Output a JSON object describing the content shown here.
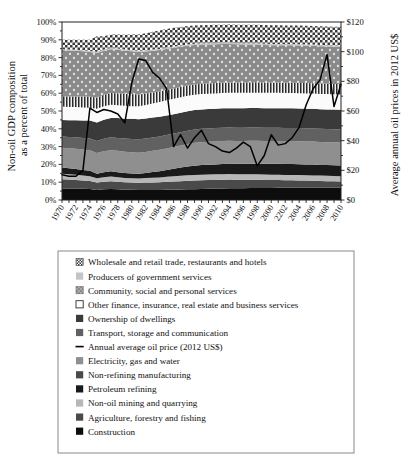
{
  "chart_data": {
    "type": "area",
    "title": "",
    "subtitle": "",
    "ylabel": "Non-oil GDP composition as a percent of total",
    "ylabel_right": "Average annual oil prices in 2012 US$",
    "xlabel": "",
    "ylim": [
      0,
      100
    ],
    "ylim_right": [
      0,
      120
    ],
    "ytick_labels": [
      "0%",
      "10%",
      "20%",
      "30%",
      "40%",
      "50%",
      "60%",
      "70%",
      "80%",
      "90%",
      "100%"
    ],
    "ytick_values": [
      0,
      10,
      20,
      30,
      40,
      50,
      60,
      70,
      80,
      90,
      100
    ],
    "ytick_labels_right": [
      "$0",
      "$20",
      "$40",
      "$60",
      "$80",
      "$100",
      "$120"
    ],
    "ytick_values_right": [
      0,
      20,
      40,
      60,
      80,
      100,
      120
    ],
    "grid": false,
    "legend_position": "bottom",
    "x": [
      1970,
      1971,
      1972,
      1973,
      1974,
      1975,
      1976,
      1977,
      1978,
      1979,
      1980,
      1981,
      1982,
      1983,
      1984,
      1985,
      1986,
      1987,
      1988,
      1989,
      1990,
      1991,
      1992,
      1993,
      1994,
      1995,
      1996,
      1997,
      1998,
      1999,
      2000,
      2001,
      2002,
      2003,
      2004,
      2005,
      2006,
      2007,
      2008,
      2009,
      2010
    ],
    "xtick_labels": [
      "1970",
      "1972",
      "1974",
      "1976",
      "1978",
      "1980",
      "1982",
      "1984",
      "1986",
      "1988",
      "1990",
      "1992",
      "1994",
      "1996",
      "1998",
      "2000",
      "2202",
      "2004",
      "2006",
      "2008",
      "2010"
    ],
    "xtick_values": [
      1970,
      1972,
      1974,
      1976,
      1978,
      1980,
      1982,
      1984,
      1986,
      1988,
      1990,
      1992,
      1994,
      1996,
      1998,
      2000,
      2002,
      2004,
      2006,
      2008,
      2010
    ],
    "stack_order_bottom_to_top": [
      "Construction",
      "Agriculture, forestry and fishing",
      "Non-oil mining and quarrying",
      "Petroleum refining",
      "Non-refining manufacturing",
      "Electricity, gas and water",
      "Transport, storage and communication",
      "Ownership of dwellings",
      "Other finance, insurance, real estate and business services",
      "Community, social and personal services",
      "Producers of government services",
      "Wholesale and retail trade, restaurants and hotels"
    ],
    "series": [
      {
        "name": "Construction",
        "fill": "#0d0d0d",
        "pattern": "solid",
        "values": [
          6.5,
          6.5,
          6.4,
          6.3,
          6.2,
          5.6,
          6.0,
          6.2,
          6.0,
          5.8,
          5.7,
          5.6,
          5.6,
          5.6,
          5.6,
          5.7,
          5.8,
          5.9,
          6.0,
          6.1,
          6.2,
          6.3,
          6.4,
          6.5,
          6.6,
          6.6,
          6.6,
          6.7,
          6.8,
          6.8,
          6.8,
          6.9,
          6.9,
          7.0,
          7.0,
          7.0,
          7.0,
          7.0,
          7.0,
          7.0,
          7.0
        ]
      },
      {
        "name": "Agriculture, forestry and fishing",
        "fill": "#4a4a4a",
        "pattern": "solid",
        "values": [
          5.2,
          5.0,
          4.9,
          4.7,
          4.5,
          4.3,
          4.3,
          4.4,
          4.3,
          4.2,
          4.1,
          4.1,
          4.2,
          4.3,
          4.4,
          4.5,
          4.6,
          4.7,
          4.8,
          4.9,
          4.9,
          4.9,
          4.9,
          4.9,
          4.9,
          4.8,
          4.8,
          4.7,
          4.6,
          4.5,
          4.4,
          4.3,
          4.2,
          4.1,
          4.0,
          3.9,
          3.8,
          3.7,
          3.6,
          3.5,
          3.4
        ]
      },
      {
        "name": "Non-oil mining and quarrying",
        "fill": "#b7b7b7",
        "pattern": "solid",
        "values": [
          3.1,
          3.0,
          2.9,
          2.8,
          2.7,
          2.3,
          2.5,
          2.6,
          2.5,
          2.4,
          2.4,
          2.4,
          2.5,
          2.6,
          2.7,
          2.8,
          2.9,
          3.0,
          3.1,
          3.1,
          3.1,
          3.1,
          3.1,
          3.1,
          3.1,
          3.0,
          3.0,
          3.0,
          3.0,
          3.0,
          3.0,
          3.0,
          3.0,
          3.0,
          3.0,
          3.0,
          3.0,
          3.0,
          3.0,
          3.0,
          3.0
        ]
      },
      {
        "name": "Petroleum refining",
        "fill": "#1a1a1a",
        "pattern": "solid",
        "values": [
          3.4,
          3.3,
          3.2,
          3.1,
          3.0,
          2.5,
          2.8,
          2.9,
          2.8,
          2.7,
          2.7,
          2.7,
          2.9,
          3.2,
          3.5,
          3.9,
          4.3,
          4.6,
          4.9,
          5.2,
          5.4,
          5.5,
          5.6,
          5.7,
          5.8,
          5.9,
          5.9,
          6.0,
          6.0,
          6.0,
          6.1,
          6.1,
          6.1,
          6.1,
          6.1,
          6.1,
          6.1,
          6.0,
          6.0,
          6.0,
          6.0
        ]
      },
      {
        "name": "Non-refining manufacturing",
        "fill": "#8f8f8f",
        "pattern": "solid",
        "values": [
          11.2,
          11.3,
          11.4,
          11.5,
          11.6,
          11.7,
          11.8,
          11.9,
          12.0,
          12.0,
          11.9,
          11.8,
          11.8,
          11.9,
          12.0,
          12.1,
          12.2,
          12.4,
          12.6,
          12.8,
          12.9,
          12.9,
          12.9,
          12.9,
          12.9,
          12.9,
          12.9,
          12.9,
          12.9,
          12.9,
          12.9,
          12.9,
          12.9,
          12.9,
          12.9,
          12.9,
          12.9,
          12.9,
          12.9,
          12.9,
          12.9
        ]
      },
      {
        "name": "Electricity, gas and water",
        "fill": "#616161",
        "pattern": "solid",
        "values": [
          6.3,
          6.3,
          6.4,
          6.5,
          6.6,
          6.8,
          7.0,
          7.2,
          7.3,
          7.4,
          7.5,
          7.5,
          7.5,
          7.5,
          7.5,
          7.5,
          7.5,
          7.5,
          7.5,
          7.5,
          7.5,
          7.5,
          7.5,
          7.5,
          7.4,
          7.4,
          7.4,
          7.4,
          7.4,
          7.4,
          7.4,
          7.4,
          7.4,
          7.4,
          7.4,
          7.4,
          7.4,
          7.4,
          7.4,
          7.4,
          7.4
        ]
      },
      {
        "name": "Transport, storage and communication",
        "fill": "#3a3a3a",
        "pattern": "solid",
        "values": [
          9.2,
          9.4,
          9.6,
          9.8,
          10.0,
          10.4,
          10.7,
          10.9,
          11.1,
          11.2,
          11.3,
          11.3,
          11.3,
          11.2,
          11.1,
          11.0,
          10.9,
          10.9,
          10.9,
          10.9,
          10.9,
          10.9,
          10.9,
          10.9,
          10.9,
          11.0,
          11.0,
          11.0,
          11.0,
          11.0,
          11.0,
          11.0,
          11.0,
          11.0,
          11.0,
          11.0,
          11.0,
          11.0,
          11.0,
          11.0,
          11.0
        ]
      },
      {
        "name": "Ownership of dwellings",
        "fill": "#fbfbfb",
        "pattern": "solid",
        "values": [
          7.6,
          7.5,
          7.4,
          7.3,
          7.2,
          7.6,
          7.5,
          7.4,
          7.3,
          7.2,
          7.1,
          7.3,
          7.6,
          7.9,
          8.2,
          8.5,
          8.7,
          8.7,
          8.7,
          8.6,
          8.6,
          8.6,
          8.6,
          8.6,
          8.6,
          8.6,
          8.6,
          8.6,
          8.6,
          8.6,
          8.6,
          8.6,
          8.6,
          8.6,
          8.6,
          8.6,
          8.6,
          8.6,
          8.6,
          8.6,
          8.6
        ]
      },
      {
        "name": "Other finance, insurance, real estate and business services",
        "fill": "#d6d6d6",
        "pattern": "vertical-stripes",
        "values": [
          5.8,
          5.9,
          6.0,
          6.1,
          6.2,
          6.4,
          6.5,
          6.6,
          6.7,
          6.8,
          6.8,
          6.6,
          6.4,
          6.2,
          6.0,
          5.9,
          5.8,
          5.8,
          5.8,
          5.8,
          5.8,
          5.8,
          5.8,
          5.8,
          5.8,
          5.8,
          5.8,
          5.8,
          5.8,
          5.8,
          5.8,
          5.8,
          5.8,
          5.8,
          5.8,
          5.8,
          5.8,
          5.8,
          5.8,
          5.8,
          5.8
        ]
      },
      {
        "name": "Community, social and personal services",
        "fill": "#8a8a8a",
        "pattern": "dots",
        "values": [
          26.0,
          25.8,
          25.6,
          25.4,
          25.2,
          25.0,
          24.8,
          24.6,
          24.4,
          24.2,
          24.0,
          23.8,
          23.6,
          23.4,
          23.2,
          23.0,
          22.8,
          22.6,
          22.4,
          22.2,
          22.0,
          21.9,
          21.8,
          21.7,
          21.6,
          21.5,
          21.4,
          21.3,
          21.2,
          21.1,
          21.0,
          21.0,
          21.0,
          21.0,
          21.0,
          21.0,
          21.0,
          21.0,
          21.0,
          21.0,
          21.0
        ]
      },
      {
        "name": "Producers of government services",
        "fill": "#c4c4c4",
        "pattern": "solid",
        "values": [
          0.6,
          0.6,
          0.6,
          0.6,
          0.6,
          0.7,
          0.7,
          0.7,
          0.7,
          0.7,
          0.7,
          0.7,
          0.7,
          0.7,
          0.7,
          0.7,
          0.7,
          0.7,
          0.7,
          0.7,
          0.7,
          0.7,
          0.7,
          0.7,
          0.7,
          0.7,
          0.7,
          0.7,
          0.7,
          0.7,
          0.7,
          0.7,
          0.7,
          0.7,
          0.7,
          0.7,
          0.7,
          0.7,
          0.7,
          0.7,
          0.7
        ]
      },
      {
        "name": "Wholesale and retail trade, restaurants and hotels",
        "fill": "#e8e8e8",
        "pattern": "checker",
        "values": [
          5.1,
          5.4,
          5.6,
          5.9,
          6.2,
          8.7,
          7.4,
          7.6,
          7.9,
          8.2,
          8.8,
          9.2,
          9.6,
          10.0,
          10.3,
          10.4,
          10.5,
          10.4,
          10.3,
          10.2,
          10.2,
          10.2,
          10.2,
          10.2,
          10.3,
          10.3,
          10.4,
          10.4,
          10.5,
          10.5,
          10.5,
          10.5,
          10.5,
          10.5,
          10.5,
          10.5,
          10.5,
          10.5,
          10.5,
          10.5,
          10.5
        ]
      }
    ],
    "line_series": {
      "name": "Annual average oil price (2012 US$)",
      "color": "#000000",
      "axis": "right",
      "units": "2012 US$ per barrel",
      "values": [
        17,
        16,
        16,
        20,
        62,
        59,
        61,
        60,
        58,
        52,
        79,
        95,
        94,
        86,
        82,
        75,
        36,
        44,
        35,
        42,
        47,
        38,
        36,
        33,
        32,
        35,
        39,
        36,
        23,
        30,
        44,
        37,
        38,
        42,
        49,
        64,
        75,
        81,
        98,
        63,
        78
      ]
    }
  },
  "legend": {
    "items": [
      {
        "label": "Wholesale and retail trade, restaurants and hotels",
        "swatch": "checker",
        "color": "#e8e8e8"
      },
      {
        "label": "Producers of government services",
        "swatch": "solid",
        "color": "#c4c4c4"
      },
      {
        "label": "Community, social and personal services",
        "swatch": "dots",
        "color": "#8a8a8a"
      },
      {
        "label": "Other finance, insurance, real estate and business services",
        "swatch": "open",
        "color": "#ffffff"
      },
      {
        "label": "Ownership of dwellings",
        "swatch": "solid",
        "color": "#3a3a3a"
      },
      {
        "label": "Transport, storage and communication",
        "swatch": "solid",
        "color": "#616161"
      },
      {
        "label": "Annual average oil price (2012 US$)",
        "swatch": "line",
        "color": "#000000"
      },
      {
        "label": "Electricity, gas and water",
        "swatch": "solid",
        "color": "#8f8f8f"
      },
      {
        "label": "Non-refining manufacturing",
        "swatch": "solid",
        "color": "#4a4a4a"
      },
      {
        "label": "Petroleum refining",
        "swatch": "solid",
        "color": "#1a1a1a"
      },
      {
        "label": "Non-oil mining and quarrying",
        "swatch": "solid",
        "color": "#b7b7b7"
      },
      {
        "label": "Agriculture, forestry and fishing",
        "swatch": "solid",
        "color": "#4a4a4a"
      },
      {
        "label": "Construction",
        "swatch": "solid",
        "color": "#0d0d0d"
      }
    ]
  }
}
